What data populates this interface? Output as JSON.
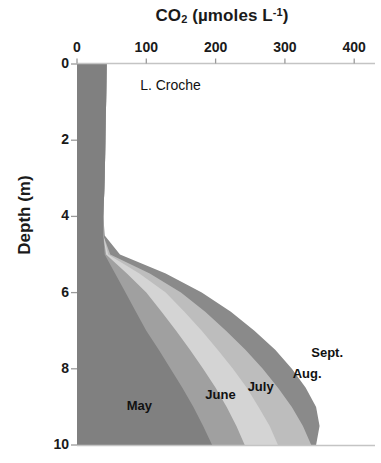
{
  "figure": {
    "site_label": "L. Croche"
  },
  "axes": {
    "x_title_main": "CO",
    "x_title_sub": "2",
    "x_title_unit_pre": " (µmoles L",
    "x_title_sup": "-1",
    "x_title_unit_post": ")",
    "x_title_full": "CO2 (µmoles L-1)",
    "y_title": "Depth (m)",
    "x_ticks": [
      "0",
      "100",
      "200",
      "300",
      "400"
    ],
    "y_ticks": [
      "0",
      "2",
      "4",
      "6",
      "8",
      "10"
    ]
  },
  "colors": {
    "may": "#808080",
    "june": "#a0a0a0",
    "july": "#d4d4d4",
    "aug": "#bdbdbd",
    "sept": "#8a8a8a",
    "axis": "#bfbfbf",
    "text": "#1a1a1a",
    "background": "#ffffff"
  },
  "chart_data": {
    "type": "area",
    "title": "CO2 (µmoles L-1)",
    "subtitle": "L. Croche",
    "xlabel": "CO2 (µmoles L-1)",
    "ylabel": "Depth (m)",
    "xlim": [
      0,
      430
    ],
    "ylim": [
      10,
      0
    ],
    "y_inverted": true,
    "x_axis_position": "top",
    "grid": false,
    "legend": "in-plot labels",
    "x_ticks": [
      0,
      100,
      200,
      300,
      400
    ],
    "y_ticks": [
      0,
      2,
      4,
      6,
      8,
      10
    ],
    "depths": [
      0,
      1,
      2,
      3,
      4,
      4.5,
      5,
      5.5,
      6,
      6.5,
      7,
      7.5,
      8,
      8.5,
      9,
      9.5,
      10
    ],
    "series": [
      {
        "name": "May",
        "color": "#808080",
        "values": [
          43,
          42,
          41,
          40,
          38,
          38,
          40,
          55,
          70,
          85,
          100,
          118,
          135,
          152,
          168,
          182,
          195
        ]
      },
      {
        "name": "June",
        "color": "#a0a0a0",
        "values": [
          43,
          42,
          41,
          40,
          38,
          38,
          42,
          72,
          100,
          122,
          143,
          163,
          182,
          200,
          216,
          230,
          242
        ]
      },
      {
        "name": "July",
        "color": "#d4d4d4",
        "values": [
          43,
          42,
          41,
          40,
          38,
          38,
          45,
          90,
          128,
          155,
          180,
          203,
          225,
          245,
          262,
          278,
          290
        ]
      },
      {
        "name": "Aug.",
        "color": "#bdbdbd",
        "values": [
          43,
          42,
          41,
          40,
          38,
          38,
          48,
          105,
          150,
          185,
          215,
          243,
          268,
          290,
          310,
          326,
          338
        ]
      },
      {
        "name": "Sept.",
        "color": "#8a8a8a",
        "values": [
          43,
          42,
          41,
          40,
          38,
          40,
          62,
          128,
          180,
          222,
          256,
          286,
          310,
          330,
          345,
          350,
          345
        ]
      }
    ],
    "annotations": [
      {
        "text": "L. Croche",
        "x": 135,
        "y": 0.55
      },
      {
        "text": "May",
        "x": 90,
        "y": 8.95
      },
      {
        "text": "June",
        "x": 207,
        "y": 8.65
      },
      {
        "text": "July",
        "x": 265,
        "y": 8.45
      },
      {
        "text": "Aug.",
        "x": 332,
        "y": 8.1
      },
      {
        "text": "Sept.",
        "x": 361,
        "y": 7.55
      }
    ]
  }
}
